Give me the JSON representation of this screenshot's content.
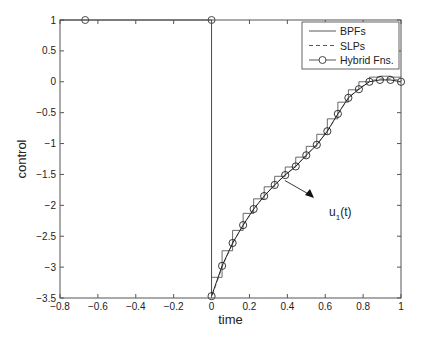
{
  "chart_data": {
    "type": "line",
    "title": "",
    "xlabel": "time",
    "ylabel": "control",
    "xlim": [
      -0.8,
      1
    ],
    "ylim": [
      -3.5,
      1
    ],
    "grid": false,
    "xticks": [
      -0.8,
      -0.6,
      -0.4,
      -0.2,
      0,
      0.2,
      0.4,
      0.6,
      0.8,
      1
    ],
    "xtick_labels": [
      "−0.8",
      "−0.6",
      "−0.4",
      "−0.2",
      "0",
      "0.2",
      "0.4",
      "0.6",
      "0.8",
      "1"
    ],
    "yticks": [
      1,
      0.5,
      0,
      -0.5,
      -1,
      -1.5,
      -2,
      -2.5,
      -3,
      -3.5
    ],
    "ytick_labels": [
      "1",
      "0.5",
      "0",
      "−0.5",
      "−1",
      "−1.5",
      "−2",
      "−2.5",
      "−3",
      "−3.5"
    ],
    "legend": {
      "position": "upper right",
      "entries": [
        {
          "label": "BPFs",
          "style": "solid"
        },
        {
          "label": "SLPs",
          "style": "dashed"
        },
        {
          "label": "Hybrid Fns.",
          "style": "solid-circle"
        }
      ]
    },
    "annotation": {
      "text": "u",
      "subscript": "1",
      "suffix": "(t)",
      "arrow_from": [
        0.44,
        -1.55
      ],
      "arrow_to": [
        0.55,
        -1.95
      ]
    },
    "x": [
      0,
      0.0556,
      0.1111,
      0.1667,
      0.2222,
      0.2778,
      0.3333,
      0.3889,
      0.4444,
      0.5,
      0.5556,
      0.6111,
      0.6667,
      0.7222,
      0.7778,
      0.8333,
      0.8889,
      0.9444,
      1.0
    ],
    "series": [
      {
        "name": "BPFs",
        "style": "step",
        "values": [
          -3.47,
          -2.98,
          -2.61,
          -2.32,
          -2.06,
          -1.85,
          -1.67,
          -1.51,
          -1.37,
          -1.19,
          -1.02,
          -0.8,
          -0.52,
          -0.26,
          -0.12,
          0.0,
          0.03,
          0.03,
          0.0
        ]
      },
      {
        "name": "SLPs",
        "style": "dashed",
        "values": [
          -3.47,
          -2.98,
          -2.61,
          -2.32,
          -2.06,
          -1.85,
          -1.67,
          -1.51,
          -1.37,
          -1.19,
          -1.02,
          -0.8,
          -0.52,
          -0.26,
          -0.12,
          0.0,
          0.03,
          0.03,
          0.0
        ]
      },
      {
        "name": "Hybrid Fns.",
        "style": "solid-circle",
        "values": [
          -3.47,
          -2.98,
          -2.61,
          -2.32,
          -2.06,
          -1.85,
          -1.67,
          -1.51,
          -1.37,
          -1.19,
          -1.02,
          -0.8,
          -0.52,
          -0.26,
          -0.12,
          0.0,
          0.03,
          0.03,
          0.0
        ]
      }
    ],
    "extra_segments": {
      "top_line": {
        "x": [
          -0.8,
          0
        ],
        "y": [
          1,
          1
        ],
        "markers": [
          [
            -0.667,
            1
          ],
          [
            0,
            1
          ]
        ]
      },
      "vertical_line": {
        "x": [
          0,
          0
        ],
        "y": [
          1,
          -3.47
        ]
      }
    }
  }
}
